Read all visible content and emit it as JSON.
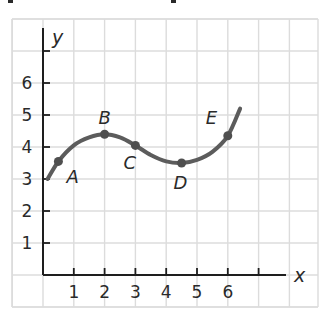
{
  "chart_data": {
    "type": "line",
    "title": "",
    "xlabel": "x",
    "ylabel": "y",
    "xlim": [
      0,
      8
    ],
    "ylim": [
      0,
      7.5
    ],
    "grid": true,
    "legend": null,
    "x_ticks": [
      1,
      2,
      3,
      4,
      5,
      6,
      7
    ],
    "x_tick_labels": [
      "1",
      "2",
      "3",
      "4",
      "5",
      "6",
      ""
    ],
    "y_ticks": [
      1,
      2,
      3,
      4,
      5,
      6,
      7
    ],
    "y_tick_labels": [
      "1",
      "2",
      "3",
      "4",
      "5",
      "6",
      ""
    ],
    "curve": {
      "x": [
        0.15,
        0.5,
        1.0,
        1.5,
        2.0,
        2.5,
        3.0,
        3.5,
        4.0,
        4.5,
        5.0,
        5.5,
        6.0,
        6.4
      ],
      "y": [
        3.0,
        3.55,
        4.05,
        4.3,
        4.4,
        4.3,
        4.05,
        3.75,
        3.55,
        3.5,
        3.6,
        3.85,
        4.35,
        5.2
      ]
    },
    "points": [
      {
        "label": "A",
        "x": 0.5,
        "y": 3.55
      },
      {
        "label": "B",
        "x": 2.0,
        "y": 4.4
      },
      {
        "label": "C",
        "x": 3.0,
        "y": 4.05
      },
      {
        "label": "D",
        "x": 4.5,
        "y": 3.5
      },
      {
        "label": "E",
        "x": 6.0,
        "y": 4.35
      }
    ]
  },
  "layout": {
    "origin_px": [
      43,
      275
    ],
    "unit_x_px": 30.8,
    "unit_y_px": 32,
    "grid_left": 12,
    "grid_top": 19,
    "grid_right": 318,
    "grid_bottom": 307,
    "colors": {
      "grid": "#dcdcdc",
      "axis": "#1e1e1e",
      "curve": "#5c5c5c"
    }
  }
}
